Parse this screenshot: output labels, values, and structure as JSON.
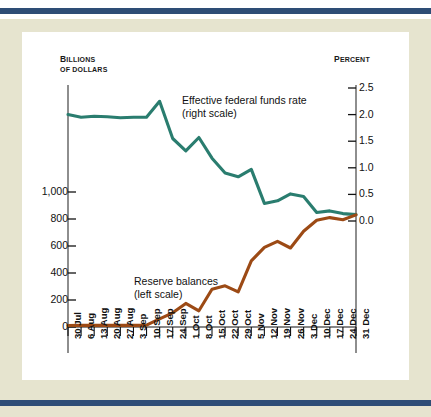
{
  "figure": {
    "background_color": "#e6e4cf",
    "band_color": "#2e4d76",
    "plot_background": "#ffffff"
  },
  "chart_data": {
    "type": "line",
    "title": "",
    "subtitle": "",
    "xlabel": "",
    "ylabel": "Billions of dollars",
    "y2label": "Percent",
    "grid": false,
    "legend_position": "inline-annotation",
    "ylim": [
      0,
      1100
    ],
    "y2lim": [
      0.0,
      2.5
    ],
    "yticks": [
      0,
      200,
      400,
      600,
      800,
      1000
    ],
    "ytick_labels": [
      "0",
      "200",
      "400",
      "600",
      "800",
      "1,000"
    ],
    "y2ticks": [
      0.0,
      0.5,
      1.0,
      1.5,
      2.0,
      2.5
    ],
    "y2tick_labels": [
      "0.0",
      "0.5",
      "1.0",
      "1.5",
      "2.0",
      "2.5"
    ],
    "categories": [
      "30 Jul",
      "6 Aug",
      "13 Aug",
      "20 Aug",
      "27 Aug",
      "3 Sep",
      "10 Sep",
      "17 Sep",
      "24 Sep",
      "1 Oct",
      "8 Oct",
      "15 Oct",
      "22 Oct",
      "29 Oct",
      "5 Nov",
      "12 Nov",
      "19 Nov",
      "26 Nov",
      "3 Dec",
      "10 Dec",
      "17 Dec",
      "24 Dec",
      "31 Dec"
    ],
    "series": [
      {
        "name": "Effective federal funds rate",
        "scale_note": "(right scale)",
        "axis": "right",
        "color": "#2a7d6f",
        "units": "percent",
        "values": [
          2.0,
          1.95,
          1.97,
          1.96,
          1.94,
          1.95,
          1.95,
          2.25,
          1.55,
          1.32,
          1.57,
          1.18,
          0.9,
          0.83,
          0.97,
          0.33,
          0.38,
          0.51,
          0.46,
          0.16,
          0.19,
          0.14,
          0.12
        ]
      },
      {
        "name": "Reserve balances",
        "scale_note": "(left scale)",
        "axis": "left",
        "color": "#9c4a15",
        "units": "billions of dollars",
        "values": [
          11,
          12,
          12,
          12,
          12,
          12,
          14,
          60,
          105,
          175,
          120,
          280,
          305,
          260,
          490,
          590,
          635,
          585,
          710,
          790,
          810,
          795,
          830
        ]
      }
    ],
    "annotations": [
      {
        "text": "Effective federal funds rate",
        "subtext": "(right scale)",
        "series": "Effective federal funds rate"
      },
      {
        "text": "Reserve balances",
        "subtext": "(left scale)",
        "series": "Reserve balances"
      }
    ]
  },
  "axis_titles": {
    "left_line1_caps": "B",
    "left_line1_rest": "ILLIONS",
    "left_line2": "OF DOLLARS",
    "right_caps": "P",
    "right_rest": "ERCENT"
  },
  "labels": {
    "ffr_line1": "Effective federal funds rate",
    "ffr_line2": "(right scale)",
    "res_line1": "Reserve balances",
    "res_line2": "(left scale)"
  }
}
